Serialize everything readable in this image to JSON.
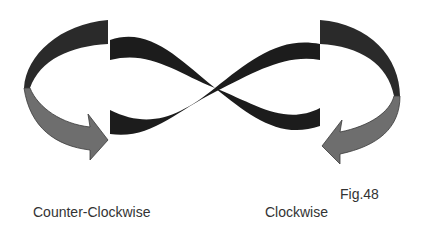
{
  "figure": {
    "number_label": "Fig.48",
    "left_label": "Counter-Clockwise",
    "right_label": "Clockwise",
    "colors": {
      "background": "#ffffff",
      "infinity_band": "#1c1c1c",
      "outer_arc": "#2a2a2a",
      "arrow_fill": "#6e6e6e",
      "arrow_outline": "#3a3a3a",
      "text": "#333333"
    }
  }
}
